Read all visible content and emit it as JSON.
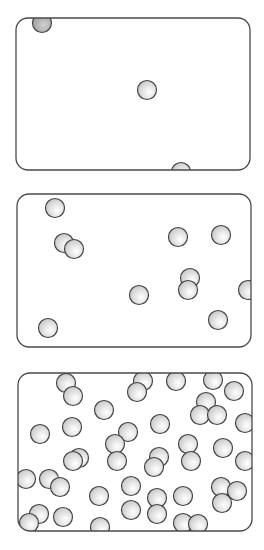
{
  "diagram": {
    "colors": {
      "border": "#4a4a4a",
      "particle_fill_light": "#f4f4f4",
      "particle_fill_mid": "#cfcfcf",
      "particle_fill_dark": "#a8a8a8",
      "particle_stroke": "#444444",
      "background": "#ffffff"
    },
    "particle_radius": 10,
    "containers": [
      {
        "id": "low-density",
        "x": 16,
        "y": 18,
        "width": 234,
        "height": 152,
        "corner_radius": 12,
        "particles": [
          {
            "x": 42,
            "y": 23,
            "shade": "dark"
          },
          {
            "x": 147,
            "y": 90
          },
          {
            "x": 181,
            "y": 172
          }
        ]
      },
      {
        "id": "medium-density",
        "x": 17,
        "y": 194,
        "width": 234,
        "height": 153,
        "corner_radius": 12,
        "particles": [
          {
            "x": 55,
            "y": 208
          },
          {
            "x": 64,
            "y": 243
          },
          {
            "x": 74,
            "y": 249
          },
          {
            "x": 178,
            "y": 237
          },
          {
            "x": 221,
            "y": 235
          },
          {
            "x": 190,
            "y": 278
          },
          {
            "x": 188,
            "y": 290
          },
          {
            "x": 139,
            "y": 295
          },
          {
            "x": 248,
            "y": 290
          },
          {
            "x": 48,
            "y": 328
          },
          {
            "x": 218,
            "y": 320
          }
        ]
      },
      {
        "id": "high-density",
        "x": 18,
        "y": 373,
        "width": 234,
        "height": 158,
        "corner_radius": 12,
        "particles": [
          {
            "x": 66,
            "y": 383
          },
          {
            "x": 73,
            "y": 396
          },
          {
            "x": 143,
            "y": 381
          },
          {
            "x": 137,
            "y": 392
          },
          {
            "x": 176,
            "y": 381
          },
          {
            "x": 213,
            "y": 380
          },
          {
            "x": 234,
            "y": 391
          },
          {
            "x": 206,
            "y": 402
          },
          {
            "x": 200,
            "y": 415
          },
          {
            "x": 217,
            "y": 415
          },
          {
            "x": 104,
            "y": 410
          },
          {
            "x": 245,
            "y": 423
          },
          {
            "x": 40,
            "y": 434
          },
          {
            "x": 72,
            "y": 427
          },
          {
            "x": 128,
            "y": 432
          },
          {
            "x": 115,
            "y": 444
          },
          {
            "x": 160,
            "y": 424
          },
          {
            "x": 188,
            "y": 444
          },
          {
            "x": 223,
            "y": 448
          },
          {
            "x": 79,
            "y": 458
          },
          {
            "x": 73,
            "y": 461
          },
          {
            "x": 117,
            "y": 461
          },
          {
            "x": 159,
            "y": 457
          },
          {
            "x": 154,
            "y": 467
          },
          {
            "x": 191,
            "y": 461
          },
          {
            "x": 245,
            "y": 461
          },
          {
            "x": 26,
            "y": 479
          },
          {
            "x": 49,
            "y": 479
          },
          {
            "x": 60,
            "y": 487
          },
          {
            "x": 131,
            "y": 486
          },
          {
            "x": 221,
            "y": 487
          },
          {
            "x": 237,
            "y": 491
          },
          {
            "x": 222,
            "y": 503
          },
          {
            "x": 99,
            "y": 496
          },
          {
            "x": 183,
            "y": 496
          },
          {
            "x": 157,
            "y": 498
          },
          {
            "x": 157,
            "y": 514
          },
          {
            "x": 131,
            "y": 510
          },
          {
            "x": 39,
            "y": 514
          },
          {
            "x": 29,
            "y": 523
          },
          {
            "x": 63,
            "y": 517
          },
          {
            "x": 100,
            "y": 527
          },
          {
            "x": 183,
            "y": 523
          },
          {
            "x": 198,
            "y": 524
          }
        ]
      }
    ]
  }
}
